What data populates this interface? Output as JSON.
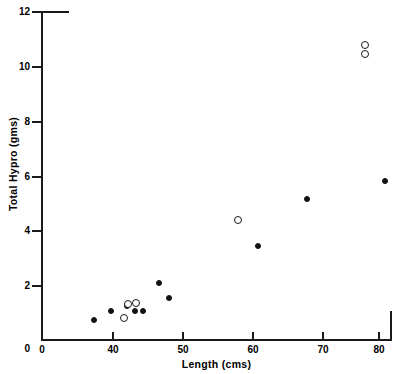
{
  "chart_data": {
    "type": "scatter",
    "title": "",
    "xlabel": "Length (cms)",
    "ylabel": "Total Hypro (gms)",
    "xlim": [
      0,
      83
    ],
    "ylim": [
      0,
      12
    ],
    "x_axis_broken": true,
    "x_break_note": "axis jumps from 0 directly to 40",
    "xticks": [
      "0",
      "40",
      "50",
      "60",
      "70",
      "80"
    ],
    "xtick_values": [
      0,
      40,
      50,
      60,
      70,
      80
    ],
    "yticks": [
      "0",
      "2",
      "4",
      "6",
      "8",
      "10",
      "12"
    ],
    "ytick_values": [
      0,
      2,
      4,
      6,
      8,
      10,
      12
    ],
    "grid": false,
    "legend": "none",
    "series": [
      {
        "name": "filled-circle-series",
        "marker": "filled-circle",
        "color": "#111111",
        "points": [
          {
            "x": 32.5,
            "y": 0.75
          },
          {
            "x": 39.8,
            "y": 1.05
          },
          {
            "x": 42.2,
            "y": 1.25
          },
          {
            "x": 43.4,
            "y": 1.05
          },
          {
            "x": 44.6,
            "y": 1.05
          },
          {
            "x": 47.0,
            "y": 2.1
          },
          {
            "x": 48.5,
            "y": 1.55
          },
          {
            "x": 62.0,
            "y": 3.45
          },
          {
            "x": 69.3,
            "y": 5.15
          },
          {
            "x": 81.0,
            "y": 5.8
          }
        ]
      },
      {
        "name": "open-circle-series",
        "marker": "open-circle",
        "color": "#1a1a1a",
        "points": [
          {
            "x": 41.8,
            "y": 0.8
          },
          {
            "x": 42.4,
            "y": 1.3
          },
          {
            "x": 43.6,
            "y": 1.35
          },
          {
            "x": 59.0,
            "y": 4.4
          },
          {
            "x": 78.0,
            "y": 10.8
          },
          {
            "x": 78.0,
            "y": 10.45
          }
        ]
      }
    ]
  },
  "axes": {
    "x_title": "Length (cms)",
    "y_title": "Total Hypro (gms)",
    "x_tick_labels": [
      "0",
      "40",
      "50",
      "60",
      "70",
      "80"
    ],
    "y_tick_labels": [
      "0",
      "2",
      "4",
      "6",
      "8",
      "10",
      "12"
    ]
  },
  "colors": {
    "axis": "#1a1a1a",
    "filled_marker": "#111111",
    "open_marker": "#1a1a1a",
    "background": "#ffffff"
  }
}
